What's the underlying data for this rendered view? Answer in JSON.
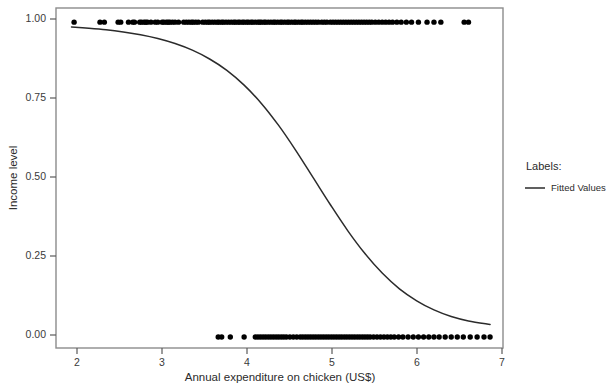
{
  "chart_data": {
    "type": "scatter",
    "title": "",
    "subtitle": "",
    "xlabel": "Annual expenditure on chicken (US$)",
    "ylabel": "Income level",
    "xlim": [
      1.82,
      7.0
    ],
    "ylim": [
      -0.035,
      1.045
    ],
    "xticks": [
      2,
      3,
      4,
      5,
      6,
      7
    ],
    "xtick_labels": [
      "2",
      "3",
      "4",
      "5",
      "6",
      "7"
    ],
    "yticks": [
      0.0,
      0.25,
      0.5,
      0.75,
      1.0
    ],
    "ytick_labels": [
      "0.00",
      "0.25",
      "0.50",
      "0.75",
      "1.00"
    ],
    "grid": false,
    "frame": "full-box",
    "point_color": "#000000",
    "line_color": "#2b2b2b",
    "legend": {
      "position": "right",
      "title": "Labels:",
      "entries": [
        {
          "label": "Fitted Values",
          "marker": "line",
          "color": "#2b2b2b"
        }
      ]
    },
    "series": [
      {
        "name": "Observed (income level = 1)",
        "type": "scatter",
        "y_value": 1.0,
        "x": [
          2.03,
          2.33,
          2.38,
          2.54,
          2.57,
          2.66,
          2.71,
          2.73,
          2.79,
          2.81,
          2.84,
          2.86,
          2.88,
          2.92,
          2.97,
          3.0,
          3.05,
          3.07,
          3.1,
          3.12,
          3.14,
          3.17,
          3.2,
          3.24,
          3.3,
          3.33,
          3.36,
          3.39,
          3.41,
          3.44,
          3.47,
          3.52,
          3.55,
          3.58,
          3.6,
          3.63,
          3.66,
          3.69,
          3.71,
          3.74,
          3.76,
          3.79,
          3.82,
          3.85,
          3.88,
          3.9,
          3.93,
          3.95,
          3.98,
          4.0,
          4.03,
          4.05,
          4.08,
          4.1,
          4.13,
          4.16,
          4.18,
          4.2,
          4.23,
          4.25,
          4.28,
          4.31,
          4.34,
          4.36,
          4.39,
          4.42,
          4.44,
          4.47,
          4.5,
          4.52,
          4.55,
          4.58,
          4.6,
          4.63,
          4.66,
          4.68,
          4.71,
          4.74,
          4.77,
          4.8,
          4.83,
          4.86,
          4.9,
          4.93,
          4.96,
          5.0,
          5.03,
          5.06,
          5.09,
          5.12,
          5.15,
          5.18,
          5.21,
          5.24,
          5.27,
          5.3,
          5.33,
          5.36,
          5.39,
          5.42,
          5.45,
          5.48,
          5.52,
          5.56,
          5.6,
          5.64,
          5.68,
          5.72,
          5.77,
          5.82,
          5.88,
          5.94,
          6.02,
          6.12,
          6.2,
          6.28,
          6.55,
          6.6
        ]
      },
      {
        "name": "Observed (income level = 0)",
        "type": "scatter",
        "y_value": 0.0,
        "x": [
          3.7,
          3.74,
          3.84,
          4.0,
          4.13,
          4.16,
          4.19,
          4.22,
          4.25,
          4.28,
          4.31,
          4.34,
          4.37,
          4.4,
          4.43,
          4.46,
          4.49,
          4.53,
          4.57,
          4.61,
          4.65,
          4.68,
          4.71,
          4.74,
          4.77,
          4.8,
          4.83,
          4.86,
          4.89,
          4.92,
          4.95,
          4.98,
          5.01,
          5.04,
          5.07,
          5.1,
          5.13,
          5.16,
          5.19,
          5.22,
          5.25,
          5.28,
          5.31,
          5.34,
          5.37,
          5.4,
          5.43,
          5.46,
          5.5,
          5.54,
          5.58,
          5.62,
          5.66,
          5.7,
          5.74,
          5.79,
          5.84,
          5.9,
          5.96,
          6.02,
          6.08,
          6.14,
          6.2,
          6.26,
          6.33,
          6.4,
          6.47,
          6.54,
          6.62,
          6.7,
          6.78,
          6.85
        ]
      },
      {
        "name": "Fitted Values",
        "type": "line",
        "x": [
          2.0,
          2.2,
          2.4,
          2.6,
          2.8,
          3.0,
          3.2,
          3.4,
          3.6,
          3.8,
          4.0,
          4.2,
          4.4,
          4.6,
          4.8,
          5.0,
          5.2,
          5.4,
          5.6,
          5.8,
          6.0,
          6.2,
          6.4,
          6.6,
          6.85
        ],
        "y": [
          0.985,
          0.981,
          0.976,
          0.969,
          0.96,
          0.948,
          0.932,
          0.911,
          0.883,
          0.847,
          0.8,
          0.742,
          0.672,
          0.592,
          0.506,
          0.42,
          0.338,
          0.265,
          0.203,
          0.153,
          0.115,
          0.086,
          0.065,
          0.051,
          0.04
        ]
      }
    ]
  }
}
